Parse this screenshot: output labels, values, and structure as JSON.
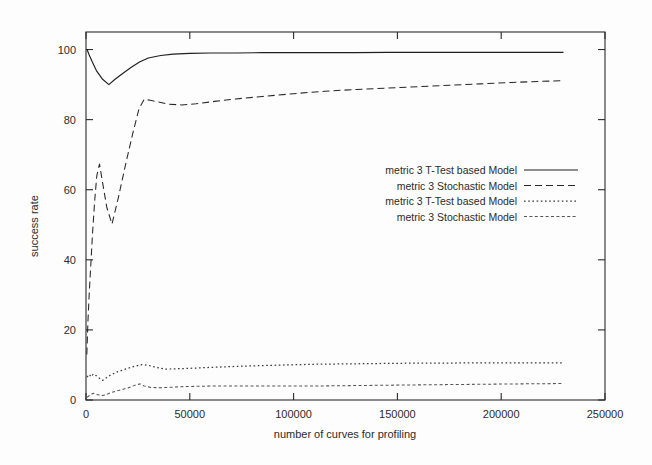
{
  "chart_data": {
    "type": "line",
    "title": "",
    "xlabel": "number of curves for profiling",
    "ylabel": "success rate",
    "xlim": [
      0,
      250000
    ],
    "ylim": [
      0,
      105
    ],
    "xticks": [
      0,
      50000,
      100000,
      150000,
      200000,
      250000
    ],
    "xtick_labels": [
      "0",
      "50000",
      "100000",
      "150000",
      "200000",
      "250000"
    ],
    "yticks": [
      0,
      20,
      40,
      60,
      80,
      100
    ],
    "ytick_labels": [
      "0",
      "20",
      "40",
      "60",
      "80",
      "100"
    ],
    "grid": false,
    "legend_position": "center-right",
    "series": [
      {
        "name": "metric 3 T-Test based Model",
        "style": "solid",
        "color": "#1f1f1f",
        "x": [
          500,
          1500,
          3000,
          5000,
          8000,
          11000,
          14000,
          18000,
          22000,
          26000,
          30000,
          36000,
          42000,
          50000,
          60000,
          72000,
          85000,
          100000,
          115000,
          130000,
          145000,
          160000,
          175000,
          190000,
          205000,
          218000,
          230000
        ],
        "y": [
          100.0,
          98.5,
          96.5,
          94.0,
          91.5,
          90.0,
          91.5,
          93.3,
          95.0,
          96.5,
          97.6,
          98.3,
          98.7,
          98.9,
          99.0,
          99.0,
          99.1,
          99.1,
          99.1,
          99.1,
          99.2,
          99.2,
          99.2,
          99.2,
          99.2,
          99.2,
          99.2
        ]
      },
      {
        "name": "metric 3 Stochastic Model",
        "style": "dashed",
        "color": "#262626",
        "x": [
          400,
          900,
          1600,
          2400,
          3200,
          4200,
          5200,
          6500,
          8000,
          10000,
          12500,
          15500,
          19000,
          22500,
          25500,
          28000,
          31000,
          35000,
          40000,
          46000,
          53000,
          62000,
          72000,
          85000,
          100000,
          115000,
          130000,
          145000,
          160000,
          175000,
          190000,
          205000,
          218000,
          230000
        ],
        "y": [
          13.0,
          22.0,
          31.0,
          39.5,
          48.0,
          57.0,
          64.0,
          67.3,
          62.0,
          55.0,
          50.2,
          57.5,
          67.0,
          76.0,
          83.0,
          85.8,
          85.5,
          85.0,
          84.4,
          84.2,
          84.5,
          85.2,
          85.9,
          86.6,
          87.4,
          88.1,
          88.6,
          89.0,
          89.4,
          89.8,
          90.2,
          90.6,
          90.9,
          91.1
        ]
      },
      {
        "name": "metric 3 T-Test based Model",
        "style": "dotted",
        "color": "#3a3a3a",
        "x": [
          500,
          1500,
          2500,
          3500,
          5000,
          6500,
          8000,
          10000,
          12000,
          15000,
          18000,
          21000,
          24000,
          27000,
          30000,
          34000,
          38000,
          43000,
          49000,
          56000,
          64000,
          73000,
          84000,
          96000,
          110000,
          125000,
          140000,
          155000,
          170000,
          185000,
          200000,
          215000,
          230000
        ],
        "y": [
          6.5,
          7.3,
          6.6,
          7.4,
          6.9,
          6.2,
          5.6,
          6.4,
          7.2,
          8.0,
          8.6,
          9.2,
          9.7,
          10.1,
          9.9,
          9.3,
          8.8,
          8.9,
          9.0,
          9.2,
          9.4,
          9.6,
          9.8,
          10.0,
          10.2,
          10.3,
          10.4,
          10.5,
          10.5,
          10.6,
          10.6,
          10.6,
          10.6
        ]
      },
      {
        "name": "metric 3 Stochastic Model",
        "style": "fine-dash",
        "color": "#555555",
        "x": [
          500,
          1500,
          2500,
          3500,
          5000,
          6500,
          8000,
          10000,
          12000,
          15000,
          18000,
          21000,
          24000,
          26000,
          28000,
          31000,
          35000,
          40000,
          46000,
          53000,
          62000,
          73000,
          85000,
          98000,
          112000,
          127000,
          142000,
          158000,
          175000,
          192000,
          210000,
          230000
        ],
        "y": [
          0.8,
          1.2,
          1.6,
          1.9,
          1.6,
          1.4,
          1.3,
          1.6,
          2.1,
          2.6,
          3.1,
          3.6,
          4.3,
          4.6,
          4.0,
          3.6,
          3.5,
          3.6,
          3.8,
          3.9,
          4.0,
          4.0,
          4.0,
          4.0,
          4.0,
          4.1,
          4.2,
          4.3,
          4.4,
          4.5,
          4.6,
          4.7
        ]
      }
    ]
  },
  "legend": {
    "entries": [
      {
        "label": "metric 3 T-Test based Model",
        "style": "solid"
      },
      {
        "label": "metric 3 Stochastic Model",
        "style": "dashed"
      },
      {
        "label": "metric 3 T-Test based Model",
        "style": "dotted"
      },
      {
        "label": "metric 3 Stochastic Model",
        "style": "fine-dash"
      }
    ]
  },
  "colors": {
    "background": "#fdfdfd",
    "axis": "#2a2a2a",
    "text": "#2b2b2b"
  }
}
